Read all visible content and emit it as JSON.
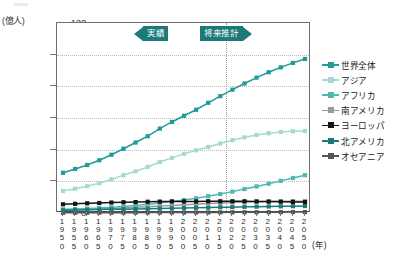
{
  "chart_data": {
    "type": "line",
    "title": "",
    "xlabel": "(年)",
    "ylabel": "(億人)",
    "ylim": [
      0,
      120
    ],
    "yticks": [
      0,
      20,
      40,
      60,
      80,
      100,
      120
    ],
    "grid": true,
    "legend_position": "right",
    "categories": [
      "1950",
      "1955",
      "1960",
      "1965",
      "1970",
      "1975",
      "1980",
      "1985",
      "1990",
      "1995",
      "2000",
      "2005",
      "2010",
      "2015",
      "2020",
      "2025",
      "2030",
      "2035",
      "2040",
      "2045",
      "2050"
    ],
    "projection_divider": "2015/2020",
    "annotations": [
      {
        "label": "実績",
        "direction": "left"
      },
      {
        "label": "将来推計",
        "direction": "right"
      }
    ],
    "series": [
      {
        "name": "世界全体",
        "color": "#219a9a",
        "values": [
          25.4,
          27.8,
          30.3,
          33.3,
          36.8,
          40.6,
          44.5,
          48.5,
          53.3,
          57.5,
          61.4,
          65.2,
          69.6,
          73.8,
          77.9,
          81.8,
          85.5,
          88.9,
          92.0,
          94.8,
          97.3
        ]
      },
      {
        "name": "アジア",
        "color": "#a6d9d4",
        "values": [
          13.9,
          15.3,
          16.9,
          18.8,
          21.2,
          23.9,
          26.4,
          29.1,
          32.2,
          34.8,
          37.4,
          39.6,
          41.7,
          43.9,
          46.0,
          47.8,
          49.3,
          50.4,
          51.2,
          51.6,
          51.8
        ]
      },
      {
        "name": "アフリカ",
        "color": "#4fb8b3",
        "values": [
          2.3,
          2.5,
          2.8,
          3.1,
          3.6,
          4.1,
          4.8,
          5.5,
          6.3,
          7.2,
          8.2,
          9.3,
          10.6,
          12.0,
          13.5,
          15.1,
          16.8,
          18.5,
          20.3,
          22.1,
          23.9
        ]
      },
      {
        "name": "南アメリカ",
        "color": "#9a9a9a",
        "values": [
          1.7,
          1.9,
          2.2,
          2.5,
          2.8,
          3.2,
          3.6,
          4.0,
          4.4,
          4.8,
          5.2,
          5.6,
          6.0,
          6.3,
          6.6,
          6.9,
          7.1,
          7.3,
          7.4,
          7.5,
          7.5
        ]
      },
      {
        "name": "ヨーロッパ",
        "color": "#141414",
        "values": [
          5.5,
          5.8,
          6.1,
          6.3,
          6.6,
          6.8,
          6.9,
          7.1,
          7.2,
          7.3,
          7.3,
          7.3,
          7.4,
          7.4,
          7.4,
          7.4,
          7.3,
          7.2,
          7.1,
          7.0,
          6.9
        ]
      },
      {
        "name": "北アメリカ",
        "color": "#1c7a7a",
        "values": [
          1.7,
          1.9,
          2.0,
          2.2,
          2.3,
          2.4,
          2.5,
          2.7,
          2.8,
          3.0,
          3.1,
          3.3,
          3.4,
          3.6,
          3.7,
          3.9,
          4.0,
          4.1,
          4.2,
          4.3,
          4.4
        ]
      },
      {
        "name": "オセアニア",
        "color": "#555555",
        "values": [
          0.13,
          0.14,
          0.16,
          0.18,
          0.19,
          0.21,
          0.23,
          0.25,
          0.27,
          0.29,
          0.31,
          0.33,
          0.36,
          0.39,
          0.42,
          0.45,
          0.48,
          0.51,
          0.54,
          0.56,
          0.58
        ]
      }
    ]
  }
}
